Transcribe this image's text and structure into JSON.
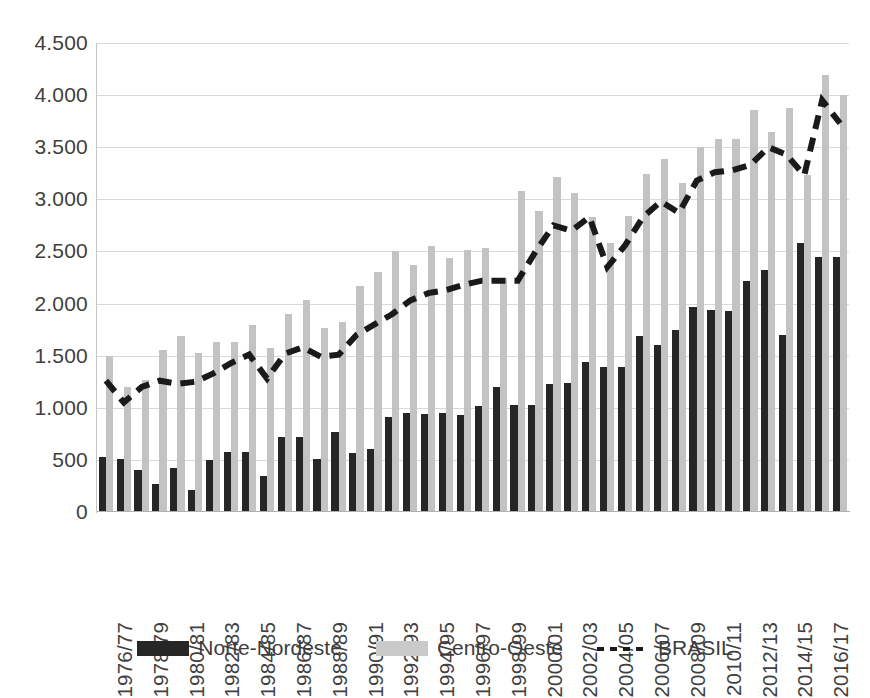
{
  "chart_data": {
    "type": "bar",
    "title": "",
    "subtitle": "",
    "xlabel": "",
    "ylabel": "",
    "ylim": [
      0,
      4500
    ],
    "ytick_step": 500,
    "grid": true,
    "legend_position": "bottom",
    "ytick_labels": [
      "0",
      "500",
      "1.000",
      "1.500",
      "2.000",
      "2.500",
      "3.000",
      "3.500",
      "4.000",
      "4.500"
    ],
    "ytick_values": [
      0,
      500,
      1000,
      1500,
      2000,
      2500,
      3000,
      3500,
      4000,
      4500
    ],
    "categories": [
      "1976/77",
      "1977/78",
      "1978/79",
      "1979/80",
      "1980/81",
      "1981/82",
      "1982/83",
      "1983/84",
      "1984/85",
      "1985/86",
      "1986/87",
      "1987/88",
      "1988/89",
      "1989/90",
      "1990/91",
      "1991/92",
      "1992/93",
      "1993/94",
      "1994/95",
      "1995/96",
      "1996/97",
      "1997/98",
      "1998/99",
      "1999/00",
      "2000/01",
      "2001/02",
      "2002/03",
      "2003/04",
      "2004/05",
      "2005/06",
      "2006/07",
      "2007/08",
      "2008/09",
      "2009/10",
      "2010/11",
      "2011/12",
      "2012/13",
      "2013/14",
      "2014/15",
      "2015/16",
      "2016/17",
      "2017/18"
    ],
    "xtick_labels": [
      "1976/77",
      "1978/79",
      "1980/81",
      "1982/83",
      "1984/85",
      "1986/87",
      "1988/89",
      "1990/91",
      "1992/93",
      "1994/95",
      "1996/97",
      "1998/99",
      "2000/01",
      "2002/03",
      "2004/05",
      "2006/07",
      "2008/09",
      "2010/11",
      "2012/13",
      "2014/15",
      "2016/17"
    ],
    "xtick_indices": [
      0,
      2,
      4,
      6,
      8,
      10,
      12,
      14,
      16,
      18,
      20,
      22,
      24,
      26,
      28,
      30,
      32,
      34,
      36,
      38,
      40
    ],
    "series": [
      {
        "name": "Norte-Nordeste",
        "kind": "bar",
        "color": "#262626",
        "values": [
          530,
          510,
          400,
          270,
          420,
          210,
          500,
          580,
          580,
          350,
          720,
          720,
          510,
          770,
          570,
          600,
          910,
          950,
          940,
          950,
          930,
          1020,
          1200,
          1030,
          1030,
          1230,
          1240,
          1440,
          1390,
          1390,
          1690,
          1600,
          1750,
          1970,
          1940,
          1930,
          2220,
          2320,
          1700,
          2580,
          2450,
          2450
        ]
      },
      {
        "name": "Centro-Oeste",
        "kind": "bar",
        "color": "#c3c3c3",
        "values": [
          1500,
          1200,
          1270,
          1550,
          1690,
          1530,
          1630,
          1630,
          1790,
          1570,
          1900,
          2030,
          1770,
          1820,
          2170,
          2300,
          2500,
          2370,
          2550,
          2440,
          2510,
          2530,
          2250,
          3080,
          2890,
          3210,
          3060,
          2830,
          2580,
          2840,
          3240,
          3390,
          3160,
          3500,
          3580,
          3580,
          3860,
          3650,
          3880,
          3230,
          4190,
          4000
        ]
      },
      {
        "name": "BRASIL",
        "kind": "line",
        "style": "dashed",
        "color": "#1a1a1a",
        "values": [
          1260,
          1050,
          1200,
          1260,
          1230,
          1250,
          1330,
          1430,
          1510,
          1280,
          1520,
          1580,
          1490,
          1510,
          1700,
          1800,
          1900,
          2030,
          2100,
          2130,
          2180,
          2220,
          2220,
          2220,
          2500,
          2750,
          2700,
          2830,
          2350,
          2560,
          2830,
          2980,
          2870,
          3180,
          3260,
          3280,
          3330,
          3500,
          3430,
          3230,
          3950,
          3730
        ]
      }
    ]
  },
  "legend": {
    "items": [
      {
        "label": "Norte-Nordeste",
        "swatch": "bar-dark"
      },
      {
        "label": "Centro-Oeste",
        "swatch": "bar-gray"
      },
      {
        "label": "BRASIL",
        "swatch": "dashed-line"
      }
    ]
  },
  "colors": {
    "norte_nordeste": "#262626",
    "centro_oeste": "#c3c3c3",
    "brasil_line": "#1a1a1a",
    "gridline": "#d9d9d9",
    "text": "#3d3d3d",
    "background": "#ffffff"
  }
}
